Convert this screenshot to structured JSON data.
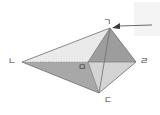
{
  "figure": {
    "type": "geometric-solid",
    "vertices": [
      {
        "id": "ga",
        "label": "ㄱ",
        "x": 110,
        "y": 28,
        "role": "apex-top"
      },
      {
        "id": "na",
        "label": "ㄴ",
        "x": 22,
        "y": 62,
        "role": "left"
      },
      {
        "id": "da",
        "label": "ㄷ",
        "x": 99,
        "y": 93,
        "role": "bottom"
      },
      {
        "id": "ra",
        "label": "ㄹ",
        "x": 136,
        "y": 62,
        "role": "right"
      },
      {
        "id": "ma",
        "label": "ㅁ",
        "x": 88,
        "y": 62,
        "role": "center-interior"
      }
    ],
    "edges": [
      {
        "from": "na",
        "to": "ga",
        "style": "solid"
      },
      {
        "from": "na",
        "to": "da",
        "style": "solid"
      },
      {
        "from": "na",
        "to": "ma",
        "style": "dotted"
      },
      {
        "from": "ga",
        "to": "ra",
        "style": "solid"
      },
      {
        "from": "ga",
        "to": "da",
        "style": "solid"
      },
      {
        "from": "ga",
        "to": "ma",
        "style": "solid"
      },
      {
        "from": "da",
        "to": "ra",
        "style": "solid"
      },
      {
        "from": "da",
        "to": "ma",
        "style": "solid"
      },
      {
        "from": "ma",
        "to": "ra",
        "style": "solid"
      }
    ],
    "faces": [
      {
        "id": "face-na-ga-ma",
        "fill": "#eaeaea"
      },
      {
        "id": "face-na-ma-da",
        "fill": "#a8a8a8"
      },
      {
        "id": "face-ga-ma-da",
        "fill": "#b5b5b5"
      },
      {
        "id": "face-ga-ra-ma",
        "fill": "#9a9a9a"
      },
      {
        "id": "face-ma-ra-da",
        "fill": "#d2d2d2"
      }
    ],
    "annotation": {
      "type": "arrow",
      "points_to": "ga",
      "direction": "right-to-left",
      "tail_x": 152,
      "tail_y": 25,
      "head_x": 114,
      "head_y": 26
    },
    "colors": {
      "outline": "#555555",
      "label_text": "#3a3a3a",
      "dotted_edge": "#8a8a8a",
      "arrow": "#404040",
      "background": "#ffffff",
      "corner_box": "#f4f4f4",
      "fill_lightest": "#eaeaea",
      "fill_light": "#d2d2d2",
      "fill_mid": "#b5b5b5",
      "fill_dark": "#a8a8a8",
      "fill_darkest": "#9a9a9a"
    }
  }
}
